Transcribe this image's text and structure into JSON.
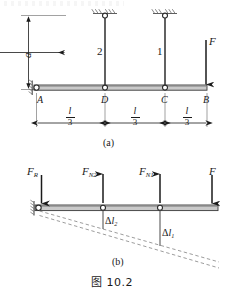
{
  "figure": {
    "number": "图 10.2",
    "subfigures": [
      {
        "id": "a",
        "caption": "(a)"
      },
      {
        "id": "b",
        "caption": "(b)"
      }
    ]
  },
  "diagram_a": {
    "name": "statically-indeterminate-beam-with-two-hangers",
    "beam_nodes": [
      {
        "label": "A",
        "role": "pin-support-left-end"
      },
      {
        "label": "D",
        "role": "hanger-2-attachment"
      },
      {
        "label": "C",
        "role": "hanger-1-attachment"
      },
      {
        "label": "B",
        "role": "free-right-end"
      }
    ],
    "hangers": [
      {
        "label": "2",
        "at_node": "D"
      },
      {
        "label": "1",
        "at_node": "C"
      }
    ],
    "vertical_dimension": {
      "label": "a",
      "description": "hanger length"
    },
    "span_dimensions": [
      {
        "numerator": "l",
        "denominator": "3"
      },
      {
        "numerator": "l",
        "denominator": "3"
      },
      {
        "numerator": "l",
        "denominator": "3"
      }
    ],
    "applied_load": {
      "label": "F",
      "direction": "down",
      "at_node": "B"
    }
  },
  "diagram_b": {
    "name": "free-body-and-deflection-diagram",
    "forces": [
      {
        "label": "F",
        "subscript": "R",
        "direction": "down",
        "position": "A"
      },
      {
        "label": "F",
        "subscript": "N2",
        "direction": "up",
        "position": "D"
      },
      {
        "label": "F",
        "subscript": "N1",
        "direction": "up",
        "position": "C"
      },
      {
        "label": "F",
        "subscript": "",
        "direction": "down",
        "position": "B"
      }
    ],
    "elongations": [
      {
        "symbol": "Δ",
        "label": "l",
        "subscript": "2",
        "position": "D"
      },
      {
        "symbol": "Δ",
        "label": "l",
        "subscript": "1",
        "position": "C"
      }
    ],
    "deflected_shape": "dashed-rotated-beam"
  },
  "colors": {
    "ink": "#1a1a1a",
    "beam_fill": "#c9c9c9",
    "beam_stroke": "#3a3a3a",
    "dashed": "#8a8a8a",
    "hatch": "#6b6b6b"
  }
}
